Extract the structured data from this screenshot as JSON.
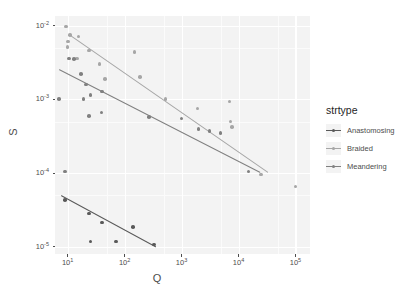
{
  "chart_data": {
    "type": "scatter",
    "title": "",
    "xlabel": "Q",
    "ylabel": "S",
    "xscale": "log10",
    "yscale": "log10",
    "xlim": [
      6.0,
      180000.0
    ],
    "ylim": [
      8e-06,
      0.0135
    ],
    "grid": true,
    "legend_position": "right",
    "legend_title": "strtype",
    "xticks": [
      {
        "value": 10,
        "label": "10",
        "exp": "1"
      },
      {
        "value": 100,
        "label": "10",
        "exp": "2"
      },
      {
        "value": 1000,
        "label": "10",
        "exp": "3"
      },
      {
        "value": 10000,
        "label": "10",
        "exp": "4"
      },
      {
        "value": 100000,
        "label": "10",
        "exp": "5"
      }
    ],
    "yticks": [
      {
        "value": 0.01,
        "label": "10",
        "exp": "-2"
      },
      {
        "value": 0.001,
        "label": "10",
        "exp": "-3"
      },
      {
        "value": 0.0001,
        "label": "10",
        "exp": "-4"
      },
      {
        "value": 1e-05,
        "label": "10",
        "exp": "-5"
      }
    ],
    "series": [
      {
        "name": "Anastomosing",
        "color": "#595959",
        "points": [
          {
            "x": 9.0,
            "y": 4.3e-05
          },
          {
            "x": 24.0,
            "y": 2.85e-05
          },
          {
            "x": 40.0,
            "y": 2.15e-05
          },
          {
            "x": 25.0,
            "y": 1.18e-05
          },
          {
            "x": 70.0,
            "y": 1.18e-05
          },
          {
            "x": 140.0,
            "y": 1.85e-05
          },
          {
            "x": 330.0,
            "y": 1.07e-05
          }
        ],
        "fit": {
          "x1": 7.5,
          "y1": 5.1e-05,
          "x2": 350.0,
          "y2": 1.02e-05
        }
      },
      {
        "name": "Braided",
        "color": "#a6a6a6",
        "points": [
          {
            "x": 9.3,
            "y": 0.0097
          },
          {
            "x": 11.0,
            "y": 0.0074
          },
          {
            "x": 15.5,
            "y": 0.0071
          },
          {
            "x": 10.2,
            "y": 0.0061
          },
          {
            "x": 10.0,
            "y": 0.0051
          },
          {
            "x": 14.5,
            "y": 0.0036
          },
          {
            "x": 24.0,
            "y": 0.0046
          },
          {
            "x": 36.0,
            "y": 0.003
          },
          {
            "x": 45.0,
            "y": 0.0019
          },
          {
            "x": 150.0,
            "y": 0.0044
          },
          {
            "x": 185.0,
            "y": 0.002
          },
          {
            "x": 520.0,
            "y": 0.00102
          },
          {
            "x": 1900.0,
            "y": 0.00075
          },
          {
            "x": 7000.0,
            "y": 0.00094
          },
          {
            "x": 7200.0,
            "y": 0.0005
          },
          {
            "x": 7600.0,
            "y": 0.00042
          },
          {
            "x": 25000.0,
            "y": 9.6e-05
          },
          {
            "x": 100000.0,
            "y": 6.6e-05
          }
        ],
        "fit": {
          "x1": 10.5,
          "y1": 0.0076,
          "x2": 33000.0,
          "y2": 0.000102
        }
      },
      {
        "name": "Meandering",
        "color": "#808080",
        "points": [
          {
            "x": 7.0,
            "y": 0.00102
          },
          {
            "x": 10.5,
            "y": 0.0036
          },
          {
            "x": 13.0,
            "y": 0.0035
          },
          {
            "x": 17.0,
            "y": 0.0022
          },
          {
            "x": 21.0,
            "y": 0.0016
          },
          {
            "x": 19.0,
            "y": 0.00102
          },
          {
            "x": 25.0,
            "y": 0.00115
          },
          {
            "x": 24.0,
            "y": 0.00059
          },
          {
            "x": 39.0,
            "y": 0.00066
          },
          {
            "x": 40.0,
            "y": 0.00128
          },
          {
            "x": 9.0,
            "y": 0.000105
          },
          {
            "x": 270.0,
            "y": 0.00058
          },
          {
            "x": 1000.0,
            "y": 0.00055
          },
          {
            "x": 2000.0,
            "y": 0.0004
          },
          {
            "x": 3100.0,
            "y": 0.000375
          },
          {
            "x": 4800.0,
            "y": 0.00035
          },
          {
            "x": 15000.0,
            "y": 0.000105
          }
        ],
        "fit": {
          "x1": 7.0,
          "y1": 0.0026,
          "x2": 24000.0,
          "y2": 0.000104
        }
      }
    ]
  },
  "legend": {
    "title": "strtype",
    "items": [
      {
        "label": "Anastomosing",
        "color": "#595959"
      },
      {
        "label": "Braided",
        "color": "#a6a6a6"
      },
      {
        "label": "Meandering",
        "color": "#808080"
      }
    ]
  },
  "axes": {
    "x_title": "Q",
    "y_title": "S"
  },
  "colors": {
    "panel_background": "#f3f3f3",
    "gridline": "#ffffff",
    "text": "#4d4d4d",
    "page_background": "#ffffff"
  }
}
